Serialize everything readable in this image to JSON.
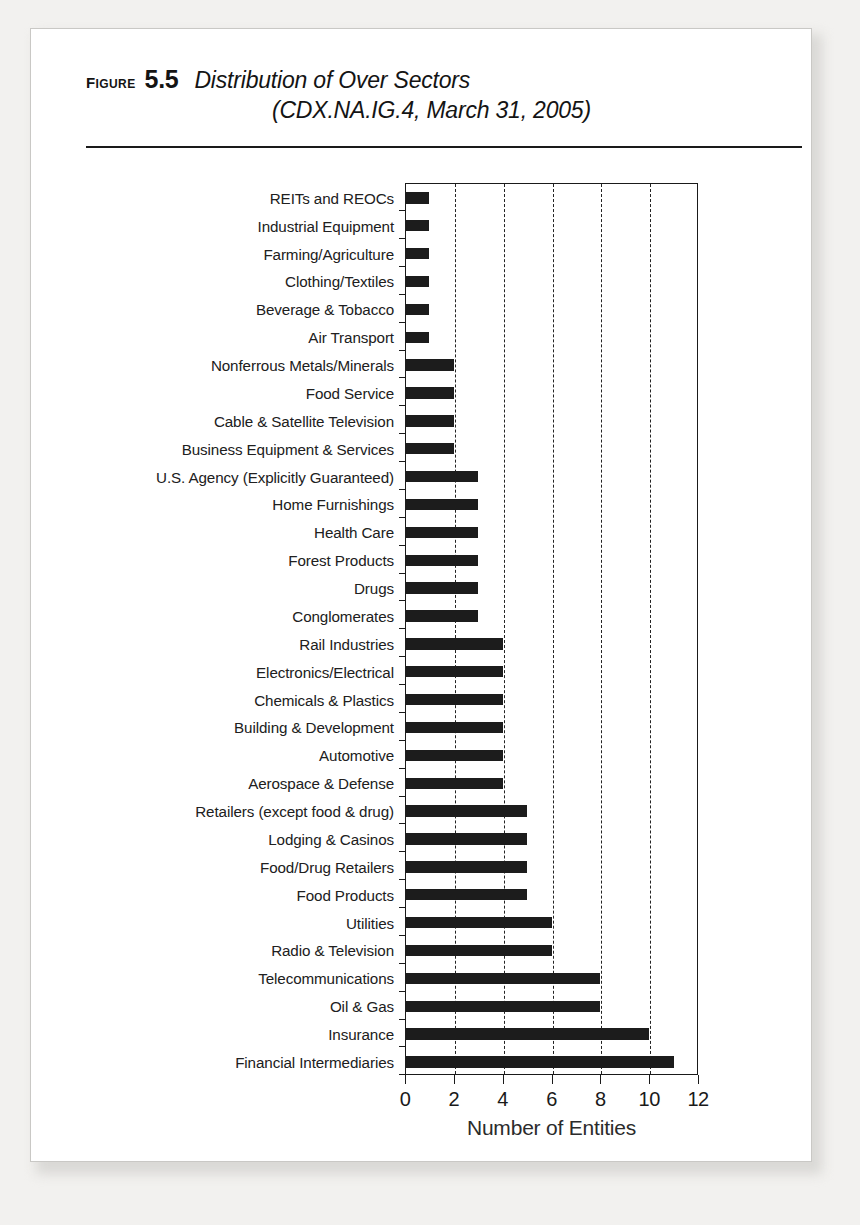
{
  "figure": {
    "label": "FIGURE",
    "number": "5.5",
    "title_line1": "Distribution of Over Sectors",
    "title_line2": "(CDX.NA.IG.4, March 31, 2005)"
  },
  "chart_data": {
    "type": "bar",
    "orientation": "horizontal",
    "title": "Distribution of Over Sectors (CDX.NA.IG.4, March 31, 2005)",
    "xlabel": "Number of Entities",
    "ylabel": "",
    "xlim": [
      0,
      12
    ],
    "xticks": [
      0,
      2,
      4,
      6,
      8,
      10,
      12
    ],
    "xticklabels": [
      "0",
      "2",
      "4",
      "6",
      "8",
      "10",
      "12"
    ],
    "grid": "vertical-dashed",
    "legend": null,
    "bar_color": "#1c1c1c",
    "categories": [
      "REITs and REOCs",
      "Industrial Equipment",
      "Farming/Agriculture",
      "Clothing/Textiles",
      "Beverage & Tobacco",
      "Air Transport",
      "Nonferrous Metals/Minerals",
      "Food Service",
      "Cable & Satellite Television",
      "Business Equipment & Services",
      "U.S. Agency (Explicitly Guaranteed)",
      "Home Furnishings",
      "Health Care",
      "Forest Products",
      "Drugs",
      "Conglomerates",
      "Rail Industries",
      "Electronics/Electrical",
      "Chemicals & Plastics",
      "Building & Development",
      "Automotive",
      "Aerospace & Defense",
      "Retailers (except food & drug)",
      "Lodging & Casinos",
      "Food/Drug Retailers",
      "Food Products",
      "Utilities",
      "Radio & Television",
      "Telecommunications",
      "Oil & Gas",
      "Insurance",
      "Financial Intermediaries"
    ],
    "values": [
      1,
      1,
      1,
      1,
      1,
      1,
      2,
      2,
      2,
      2,
      3,
      3,
      3,
      3,
      3,
      3,
      4,
      4,
      4,
      4,
      4,
      4,
      5,
      5,
      5,
      5,
      6,
      6,
      8,
      8,
      10,
      11
    ]
  }
}
